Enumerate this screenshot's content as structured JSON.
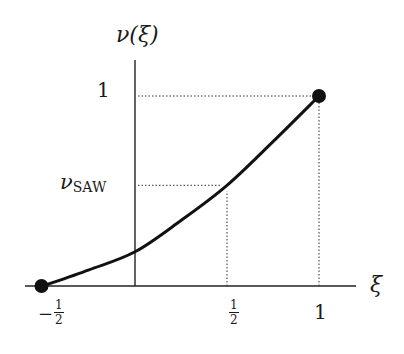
{
  "chart_data": {
    "type": "line",
    "title": "",
    "xlabel": "ξ",
    "ylabel": "ν(ξ)",
    "xlim": [
      -0.5,
      1.0
    ],
    "ylim": [
      0,
      1
    ],
    "grid": false,
    "legend": null,
    "x_ticks": [
      {
        "value": -0.5,
        "label": "−1/2",
        "numerator": "1",
        "denominator": "2",
        "sign": "−"
      },
      {
        "value": 0.5,
        "label": "1/2",
        "numerator": "1",
        "denominator": "2"
      },
      {
        "value": 1.0,
        "label": "1"
      }
    ],
    "y_ticks": [
      {
        "value": 1.0,
        "label": "1"
      },
      {
        "value": 0.53,
        "label": "ν_SAW",
        "main": "ν",
        "subscript": "SAW"
      }
    ],
    "series": [
      {
        "name": "ν(ξ)",
        "x": [
          -0.5,
          -0.25,
          0.0,
          0.25,
          0.5,
          0.75,
          1.0
        ],
        "y": [
          0.0,
          0.085,
          0.18,
          0.345,
          0.53,
          0.76,
          1.0
        ]
      }
    ],
    "markers": [
      {
        "x": -0.5,
        "y": 0.0
      },
      {
        "x": 1.0,
        "y": 1.0
      }
    ],
    "guides": [
      {
        "type": "dotted-horizontal",
        "y": 1.0,
        "from_x": 0.0,
        "to_x": 1.0
      },
      {
        "type": "dotted-vertical",
        "x": 1.0,
        "from_y": 0.0,
        "to_y": 1.0
      },
      {
        "type": "dotted-horizontal",
        "y": 0.53,
        "from_x": 0.0,
        "to_x": 0.5,
        "label": "ν_SAW"
      },
      {
        "type": "dotted-vertical",
        "x": 0.5,
        "from_y": 0.0,
        "to_y": 0.53
      }
    ]
  },
  "labels": {
    "ylabel": "ν(ξ)",
    "xlabel": "ξ",
    "ytick_one": "1",
    "nusaw_main": "ν",
    "nusaw_sub": "SAW",
    "xtick_one": "1",
    "minus": "−",
    "half_num": "1",
    "half_den": "2"
  }
}
